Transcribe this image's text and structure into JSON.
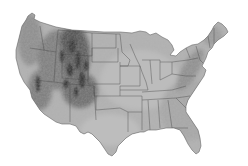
{
  "map": {
    "subject": "Contiguous United States shaded relief",
    "style": "grayscale",
    "colors": {
      "background": "#ffffff",
      "land_base": "#a8a8a8",
      "lowland": "#c4c4c4",
      "plains": "#b4b4b4",
      "mountains_dark": "#3a3a3a",
      "mountains_mid": "#6e6e6e",
      "state_border": "#4a4a4a"
    },
    "labels": []
  }
}
